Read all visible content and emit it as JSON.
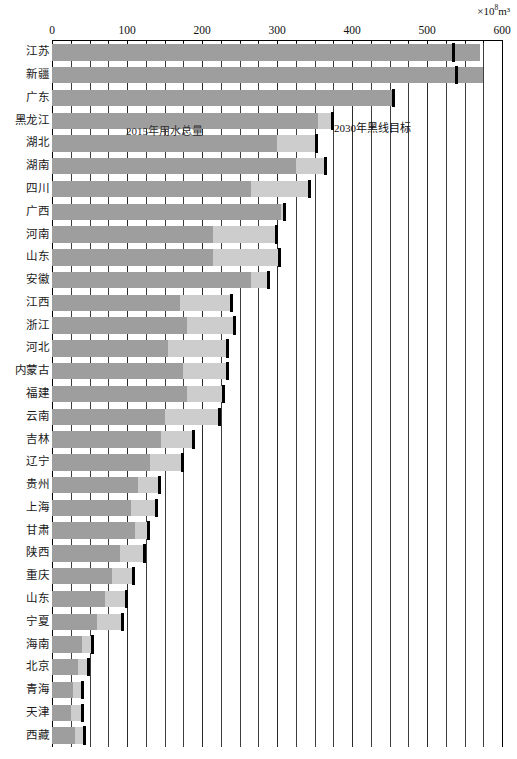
{
  "unit_label": "×10⁸m³",
  "unit_base": "×10",
  "unit_exp": "8",
  "unit_tail": "m³",
  "annotations": {
    "series_label": "2015年用水总量",
    "target_label": "2030年黑线目标"
  },
  "colors": {
    "bar_main": "#9e9e9e",
    "bar_extra": "#cdcdcd",
    "target": "#000000",
    "grid": "#3d3d3d",
    "axis": "#000000"
  },
  "chart_data": {
    "type": "bar",
    "orientation": "horizontal",
    "title": "",
    "xlabel": "×10⁸m³",
    "ylabel": "",
    "xlim": [
      0,
      600
    ],
    "xticks": [
      0,
      100,
      200,
      300,
      400,
      500,
      600
    ],
    "xtick_labels": [
      "0",
      "100",
      "200",
      "300",
      "400",
      "500",
      "600"
    ],
    "minor_tick_step": 25,
    "grid": true,
    "legend_position": "in-plot-annotation",
    "series": [
      {
        "name": "2015年用水总量",
        "values": [
          570,
          575,
          455,
          355,
          300,
          325,
          265,
          305,
          215,
          215,
          265,
          170,
          180,
          155,
          175,
          180,
          150,
          145,
          130,
          115,
          105,
          110,
          90,
          80,
          70,
          60,
          40,
          35,
          28,
          25,
          30
        ]
      },
      {
        "name": "总量上限延伸段",
        "values": [
          570,
          575,
          455,
          375,
          355,
          365,
          345,
          310,
          300,
          305,
          290,
          240,
          245,
          235,
          235,
          230,
          225,
          190,
          175,
          145,
          140,
          130,
          125,
          110,
          100,
          95,
          55,
          50,
          42,
          42,
          45
        ]
      }
    ],
    "target_series": {
      "name": "2030年黑线目标",
      "values": [
        534,
        538,
        454,
        373,
        352,
        364,
        342,
        309,
        298,
        303,
        288,
        238,
        243,
        233,
        233,
        228,
        223,
        188,
        173,
        143,
        138,
        128,
        123,
        108,
        98,
        93,
        53,
        48,
        40,
        40,
        43
      ]
    },
    "categories": [
      "江苏",
      "新疆",
      "广东",
      "黑龙江",
      "湖北",
      "湖南",
      "四川",
      "广西",
      "河南",
      "山东",
      "安徽",
      "江西",
      "浙江",
      "河北",
      "内蒙古",
      "福建",
      "云南",
      "吉林",
      "辽宁",
      "贵州",
      "上海",
      "甘肃",
      "陕西",
      "重庆",
      "山东",
      "宁夏",
      "海南",
      "北京",
      "青海",
      "天津",
      "西藏"
    ]
  }
}
